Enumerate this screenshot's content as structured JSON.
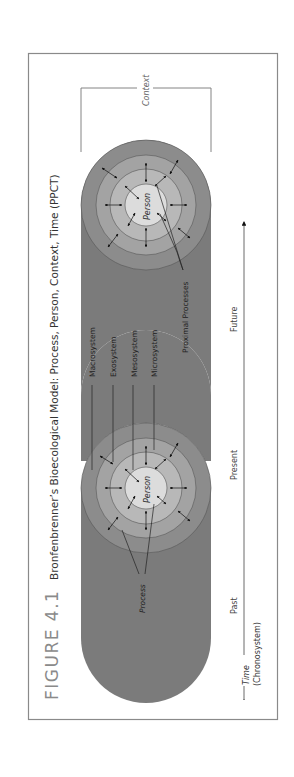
{
  "figure": {
    "label": "FIGURE 4.1",
    "title": "Bronfenbrenner’s Bioecological Model: Process, Person, Context, Time (PPCT)"
  },
  "diagram": {
    "context_label": "Context",
    "person_label": "Person",
    "process_label": "Process",
    "proximal_processes_label": "Proximal Processes",
    "systems": [
      "Macrosystem",
      "Exosystem",
      "Mesosystem",
      "Microsystem"
    ],
    "time_points": [
      "Past",
      "Present",
      "Future"
    ],
    "time_label": "Time",
    "time_sublabel": "(Chronosystem)"
  },
  "colors": {
    "frame": "#8a8a8a",
    "cylinder": "#7b7b7b",
    "ring_macro": "#8c8c8c",
    "ring_exo": "#a3a3a3",
    "ring_meso": "#b8b8b8",
    "person": "#dcdcdc",
    "label_gray": "#7a7a7a",
    "text_dark": "#333333"
  }
}
